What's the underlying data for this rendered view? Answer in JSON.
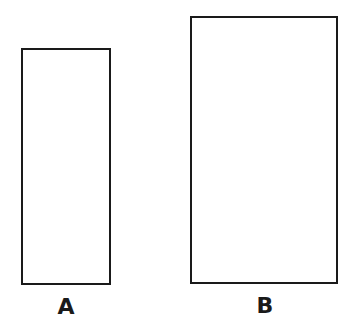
{
  "diagram": {
    "shapes": [
      {
        "id": "A",
        "label": "A",
        "type": "rectangle",
        "orientation": "portrait",
        "relative_size": "smaller"
      },
      {
        "id": "B",
        "label": "B",
        "type": "rectangle",
        "orientation": "portrait",
        "relative_size": "larger"
      }
    ],
    "colors": {
      "stroke": "#1a1a1a",
      "fill": "#ffffff"
    }
  }
}
